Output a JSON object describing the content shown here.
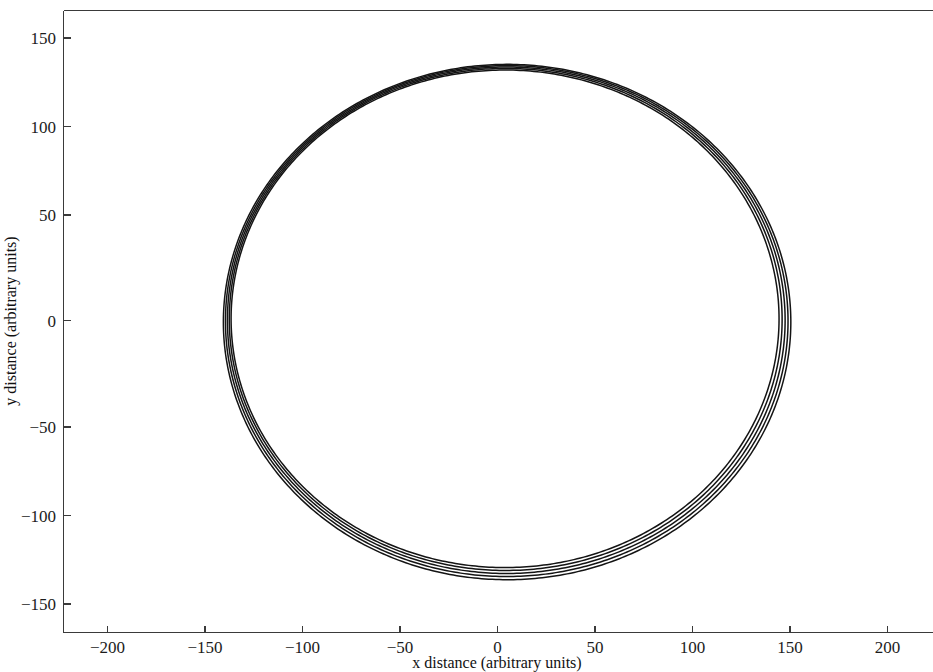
{
  "chart_data": {
    "type": "line",
    "title": "",
    "subtitle": "",
    "xlabel": "x distance (arbitrary units)",
    "ylabel": "y distance (arbitrary units)",
    "xlim": [
      -225,
      225
    ],
    "ylim": [
      -168,
      168
    ],
    "xticks": [
      -200,
      -150,
      -100,
      -50,
      0,
      50,
      100,
      150,
      200
    ],
    "xtick_labels": [
      "−200",
      "−150",
      "−100",
      "−50",
      "0",
      "50",
      "100",
      "150",
      "200"
    ],
    "yticks": [
      150,
      100,
      50,
      0,
      -50,
      -100,
      -150
    ],
    "ytick_labels": [
      "150",
      "100",
      "50",
      "0",
      "−50",
      "−100",
      "−150"
    ],
    "grid": false,
    "legend": false,
    "legend_position": "none",
    "line_color": "#141414",
    "line_width": 1.5,
    "background_color": "#ffffff",
    "axis_color": "#3a3a3a",
    "n_revolutions": 5,
    "revolutions": [
      {
        "name": "revolution 1",
        "apoapsis_radius": 150.5,
        "periapsis_radius": 140.5,
        "apsidal_angle_deg": 170.0
      },
      {
        "name": "revolution 2",
        "apoapsis_radius": 149.0,
        "periapsis_radius": 139.5,
        "apsidal_angle_deg": 176.0
      },
      {
        "name": "revolution 3",
        "apoapsis_radius": 147.5,
        "periapsis_radius": 138.5,
        "apsidal_angle_deg": 182.0
      },
      {
        "name": "revolution 4",
        "apoapsis_radius": 146.0,
        "periapsis_radius": 137.5,
        "apsidal_angle_deg": 188.0
      },
      {
        "name": "revolution 5",
        "apoapsis_radius": 144.5,
        "periapsis_radius": 136.5,
        "apsidal_angle_deg": 194.0
      }
    ],
    "extremes": {
      "max_x": 152,
      "min_x": -151,
      "max_y": 150,
      "min_y": -150
    }
  },
  "axes": {
    "x_axis_title": "x distance (arbitrary units)",
    "y_axis_title": "y distance (arbitrary units)"
  },
  "x_tick_labels": {
    "t0": "−200",
    "t1": "−150",
    "t2": "−100",
    "t3": "−50",
    "t4": "0",
    "t5": "50",
    "t6": "100",
    "t7": "150",
    "t8": "200"
  },
  "y_tick_labels": {
    "t0": "150",
    "t1": "100",
    "t2": "50",
    "t3": "0",
    "t4": "−50",
    "t5": "−100",
    "t6": "−150"
  }
}
